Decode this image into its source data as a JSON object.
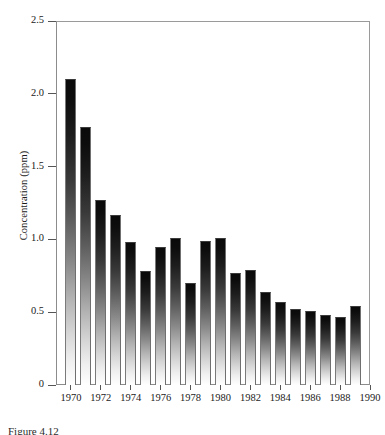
{
  "chart_data": {
    "type": "bar",
    "title": "",
    "xlabel": "",
    "ylabel": "Concentration (ppm)",
    "ylim": [
      0,
      2.5
    ],
    "xlim": [
      1969,
      1990
    ],
    "grid": false,
    "legend": null,
    "y_ticks": [
      {
        "value": 2.5,
        "label": "2.5"
      },
      {
        "value": 2.0,
        "label": "2.0"
      },
      {
        "value": 1.5,
        "label": "1.5"
      },
      {
        "value": 1.0,
        "label": "1.0"
      },
      {
        "value": 0.5,
        "label": "0.5"
      },
      {
        "value": 0.0,
        "label": "0"
      }
    ],
    "x_ticks": [
      {
        "value": 1970,
        "label": "1970"
      },
      {
        "value": 1972,
        "label": "1972"
      },
      {
        "value": 1974,
        "label": "1974"
      },
      {
        "value": 1976,
        "label": "1976"
      },
      {
        "value": 1978,
        "label": "1978"
      },
      {
        "value": 1980,
        "label": "1980"
      },
      {
        "value": 1982,
        "label": "1982"
      },
      {
        "value": 1984,
        "label": "1984"
      },
      {
        "value": 1986,
        "label": "1986"
      },
      {
        "value": 1988,
        "label": "1988"
      },
      {
        "value": 1990,
        "label": "1990"
      }
    ],
    "categories": [
      1970,
      1971,
      1972,
      1973,
      1974,
      1975,
      1976,
      1977,
      1978,
      1979,
      1980,
      1981,
      1982,
      1983,
      1984,
      1985,
      1986,
      1987,
      1988,
      1989
    ],
    "values": [
      2.1,
      1.77,
      1.27,
      1.17,
      0.98,
      0.78,
      0.95,
      1.01,
      0.7,
      0.99,
      1.01,
      0.77,
      0.79,
      0.64,
      0.57,
      0.52,
      0.51,
      0.48,
      0.47,
      0.54
    ],
    "bar_style": {
      "fill": "vertical-gradient-black-to-white",
      "top_color": "#0a0a0a",
      "bottom_color": "#ffffff",
      "edge_color": "#7a7a7a"
    }
  },
  "caption": {
    "text": "Figure 4.12"
  }
}
